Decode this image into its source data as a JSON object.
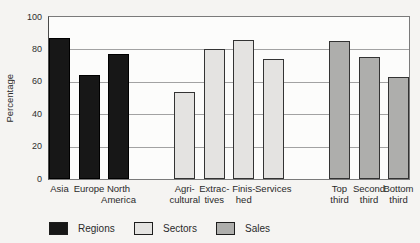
{
  "chart_data": {
    "type": "bar",
    "title": "",
    "xlabel": "",
    "ylabel": "Percentage",
    "ylim": [
      0,
      100
    ],
    "yticks": [
      0,
      20,
      40,
      60,
      80,
      100
    ],
    "grid": true,
    "legend_position": "bottom",
    "groups": [
      {
        "name": "Regions",
        "series_key": "regions",
        "color": "#171717",
        "bars": [
          {
            "label": "Asia",
            "value": 87
          },
          {
            "label": "Europe",
            "value": 64
          },
          {
            "label": "North\nAmerica",
            "value": 77
          }
        ]
      },
      {
        "name": "Sectors",
        "series_key": "sectors",
        "color": "#e4e3e1",
        "bars": [
          {
            "label": "Agri-\ncultural",
            "value": 54
          },
          {
            "label": "Extrac-\ntives",
            "value": 80
          },
          {
            "label": "Finis-\nhed",
            "value": 86
          },
          {
            "label": "Services",
            "value": 74
          }
        ]
      },
      {
        "name": "Sales",
        "series_key": "sales",
        "color": "#aeaeac",
        "bars": [
          {
            "label": "Top\nthird",
            "value": 85
          },
          {
            "label": "Second\nthird",
            "value": 75
          },
          {
            "label": "Bottom\nthird",
            "value": 63
          }
        ]
      }
    ],
    "legend": [
      {
        "label": "Regions",
        "series_key": "regions",
        "color": "#171717"
      },
      {
        "label": "Sectors",
        "series_key": "sectors",
        "color": "#e4e3e1"
      },
      {
        "label": "Sales",
        "series_key": "sales",
        "color": "#aeaeac"
      }
    ]
  }
}
